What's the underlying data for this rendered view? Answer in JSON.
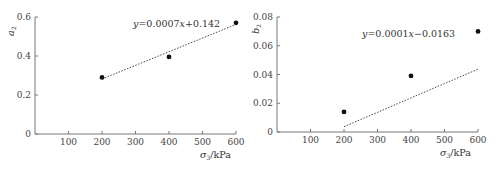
{
  "chart_data": [
    {
      "type": "scatter",
      "title": "",
      "xlabel": "σ3/kPa",
      "xlabel_parts": {
        "symbol": "σ",
        "sub": "3",
        "unit": "/kPa"
      },
      "ylabel": "a2",
      "ylabel_parts": {
        "symbol": "a",
        "sub": "2"
      },
      "xlim": [
        0,
        600
      ],
      "ylim": [
        0,
        0.6
      ],
      "xticks": [
        100,
        200,
        300,
        400,
        500,
        600
      ],
      "yticks": [
        0,
        0.2,
        0.4,
        0.6
      ],
      "ytick_labels": [
        "0",
        "0.2",
        "0.4",
        "0.6"
      ],
      "grid": false,
      "series": [
        {
          "name": "a2",
          "x": [
            200,
            400,
            600
          ],
          "y": [
            0.29,
            0.395,
            0.57
          ],
          "marker": "filled-circle"
        }
      ],
      "trendline": {
        "style": "dotted",
        "slope": 0.0007,
        "intercept": 0.142,
        "x_range": [
          200,
          600
        ]
      },
      "annotation": "y = 0.0007x + 0.142"
    },
    {
      "type": "scatter",
      "title": "",
      "xlabel": "σ3/kPa",
      "xlabel_parts": {
        "symbol": "σ",
        "sub": "3",
        "unit": "/kPa"
      },
      "ylabel": "b2",
      "ylabel_parts": {
        "symbol": "b",
        "sub": "2"
      },
      "xlim": [
        0,
        600
      ],
      "ylim": [
        0,
        0.08
      ],
      "xticks": [
        100,
        200,
        300,
        400,
        500,
        600
      ],
      "yticks": [
        0,
        0.02,
        0.04,
        0.06,
        0.08
      ],
      "ytick_labels": [
        "0",
        "0.02",
        "0.04",
        "0.06",
        "0.08"
      ],
      "grid": false,
      "series": [
        {
          "name": "b2",
          "x": [
            200,
            400,
            600
          ],
          "y": [
            0.014,
            0.039,
            0.07
          ],
          "marker": "filled-circle"
        }
      ],
      "trendline": {
        "style": "dotted",
        "slope": 0.0001,
        "intercept": -0.0163,
        "x_range": [
          200,
          600
        ]
      },
      "annotation": "y = 0.0001x − 0.0163"
    }
  ],
  "charts": {
    "left": {
      "eq_y": "y",
      "eq_eq": "=0.0007",
      "eq_x": "x",
      "eq_rest": "+0.142",
      "ylabel_sym": "a",
      "ylabel_sub": "2",
      "xlabel_sym": "σ",
      "xlabel_sub": "3",
      "xlabel_unit": "/kPa"
    },
    "right": {
      "eq_y": "y",
      "eq_eq": "=0.0001",
      "eq_x": "x",
      "eq_rest": "−0.0163",
      "ylabel_sym": "b",
      "ylabel_sub": "2",
      "xlabel_sym": "σ",
      "xlabel_sub": "3",
      "xlabel_unit": "/kPa"
    }
  }
}
